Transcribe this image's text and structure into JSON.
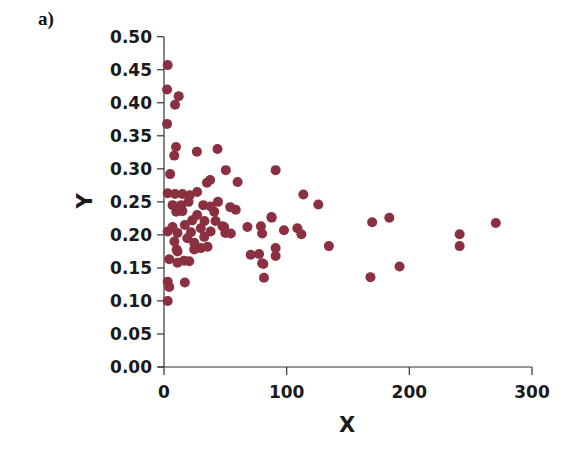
{
  "panel_label": "a)",
  "chart_data": {
    "type": "scatter",
    "title": "",
    "xlabel": "X",
    "ylabel": "Y",
    "xlim": [
      0,
      300
    ],
    "ylim": [
      0.0,
      0.5
    ],
    "grid": false,
    "legend": null,
    "marker_color": "#8b3040",
    "x_ticks": [
      0,
      100,
      200,
      300
    ],
    "x_tick_labels": [
      "0",
      "100",
      "200",
      "300"
    ],
    "y_ticks": [
      0.0,
      0.05,
      0.1,
      0.15,
      0.2,
      0.25,
      0.3,
      0.35,
      0.4,
      0.45,
      0.5
    ],
    "y_tick_labels": [
      "0.00",
      "0.05",
      "0.10",
      "0.15",
      "0.20",
      "0.25",
      "0.30",
      "0.35",
      "0.40",
      "0.45",
      "0.50"
    ],
    "points": [
      [
        3,
        0.457
      ],
      [
        2.5,
        0.42
      ],
      [
        9,
        0.397
      ],
      [
        12,
        0.41
      ],
      [
        2.5,
        0.368
      ],
      [
        9.8,
        0.333
      ],
      [
        8.4,
        0.32
      ],
      [
        26.8,
        0.326
      ],
      [
        43.6,
        0.33
      ],
      [
        5,
        0.292
      ],
      [
        50.4,
        0.298
      ],
      [
        37.6,
        0.283
      ],
      [
        35,
        0.279
      ],
      [
        60,
        0.28
      ],
      [
        3,
        0.263
      ],
      [
        9,
        0.262
      ],
      [
        15,
        0.262
      ],
      [
        21,
        0.26
      ],
      [
        27,
        0.265
      ],
      [
        7,
        0.245
      ],
      [
        14,
        0.245
      ],
      [
        32,
        0.245
      ],
      [
        38,
        0.243
      ],
      [
        10,
        0.235
      ],
      [
        15,
        0.236
      ],
      [
        41,
        0.235
      ],
      [
        23,
        0.222
      ],
      [
        33,
        0.221
      ],
      [
        42,
        0.221
      ],
      [
        3,
        0.205
      ],
      [
        7,
        0.212
      ],
      [
        11,
        0.203
      ],
      [
        8.5,
        0.19
      ],
      [
        11,
        0.175
      ],
      [
        22,
        0.204
      ],
      [
        19,
        0.195
      ],
      [
        24.6,
        0.188
      ],
      [
        24.6,
        0.178
      ],
      [
        32.8,
        0.197
      ],
      [
        30,
        0.18
      ],
      [
        35.5,
        0.182
      ],
      [
        47.7,
        0.213
      ],
      [
        50,
        0.203
      ],
      [
        54,
        0.242
      ],
      [
        58.5,
        0.238
      ],
      [
        87.6,
        0.227
      ],
      [
        49,
        0.212
      ],
      [
        54.5,
        0.202
      ],
      [
        68,
        0.212
      ],
      [
        79,
        0.213
      ],
      [
        80,
        0.202
      ],
      [
        91,
        0.168
      ],
      [
        91,
        0.298
      ],
      [
        113.6,
        0.261
      ],
      [
        125.8,
        0.246
      ],
      [
        87.8,
        0.226
      ],
      [
        97.8,
        0.207
      ],
      [
        108.7,
        0.21
      ],
      [
        112,
        0.201
      ],
      [
        91,
        0.18
      ],
      [
        134.4,
        0.183
      ],
      [
        169.7,
        0.219
      ],
      [
        183.7,
        0.226
      ],
      [
        192,
        0.152
      ],
      [
        168.3,
        0.136
      ],
      [
        81,
        0.156
      ],
      [
        81.5,
        0.135
      ],
      [
        270.5,
        0.218
      ],
      [
        241,
        0.201
      ],
      [
        241,
        0.183
      ],
      [
        3,
        0.1
      ],
      [
        3,
        0.129
      ],
      [
        4.3,
        0.121
      ],
      [
        17,
        0.128
      ],
      [
        4.3,
        0.163
      ],
      [
        11,
        0.158
      ],
      [
        16.4,
        0.161
      ],
      [
        20.6,
        0.16
      ],
      [
        10.3,
        0.178
      ],
      [
        70.7,
        0.17
      ],
      [
        77.5,
        0.171
      ],
      [
        80,
        0.157
      ],
      [
        17,
        0.215
      ],
      [
        27,
        0.23
      ],
      [
        38,
        0.205
      ],
      [
        44,
        0.25
      ],
      [
        20,
        0.25
      ],
      [
        30,
        0.21
      ]
    ]
  }
}
